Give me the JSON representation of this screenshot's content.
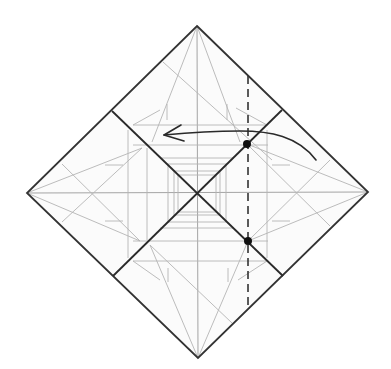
{
  "diagram": {
    "type": "origami-fold-step",
    "colors": {
      "background": "#ffffff",
      "paper": "#fbfbfb",
      "edge": "#333333",
      "crease": "#b4b4b4",
      "valley_fold": "#333333",
      "arrow": "#2a2a2a",
      "reference_point": "#111111"
    },
    "paper_square": {
      "top": [
        197,
        26
      ],
      "right": [
        368,
        192
      ],
      "bottom": [
        198,
        358
      ],
      "left": [
        27,
        193
      ],
      "center": [
        197,
        193
      ]
    },
    "valley_fold_line": {
      "x": 248,
      "y_start": 76,
      "y_end": 309
    },
    "reference_points": [
      {
        "name": "upper-reference-point",
        "x": 247,
        "y": 144
      },
      {
        "name": "lower-reference-point",
        "x": 248,
        "y": 241
      }
    ],
    "fold_arrow": {
      "direction": "left",
      "start": [
        316,
        160
      ],
      "end": [
        164,
        135
      ]
    }
  }
}
